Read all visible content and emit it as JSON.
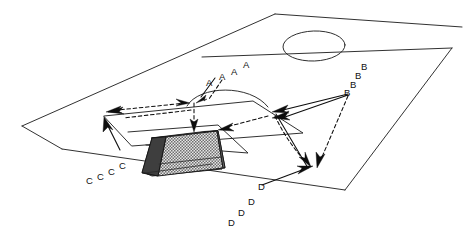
{
  "diagram": {
    "type": "pitch-diagram",
    "view": "three-quarter perspective",
    "canvas": {
      "width": 464,
      "height": 239
    },
    "colors": {
      "background": "#ffffff",
      "line": "#1a1a1a",
      "movement": "#0d0d0d",
      "net_fill": "#d6d6d6",
      "goal_side_shadow": "#4a4a4a"
    },
    "pitch": {
      "outline_note": "half pitch shown in perspective",
      "features": [
        {
          "name": "touchline-top",
          "label": ""
        },
        {
          "name": "touchline-bottom",
          "label": ""
        },
        {
          "name": "goal-line",
          "label": ""
        },
        {
          "name": "halfway-line",
          "label": ""
        },
        {
          "name": "centre-circle",
          "label": ""
        },
        {
          "name": "penalty-area",
          "label": ""
        },
        {
          "name": "goal-area",
          "label": ""
        },
        {
          "name": "penalty-arc",
          "label": ""
        }
      ]
    },
    "goal": {
      "name": "goal-with-net",
      "label": ""
    },
    "groups": [
      {
        "id": "A",
        "label": "A",
        "letter": "A",
        "count": 4,
        "labels": [
          "A",
          "A",
          "A",
          "A"
        ],
        "position": "centre, above penalty arc",
        "movement": "attacking run toward goal"
      },
      {
        "id": "B",
        "label": "B",
        "letter": "B",
        "count": 4,
        "labels": [
          "B",
          "B",
          "B",
          "B"
        ],
        "position": "right side, near halfway line",
        "movement": "run toward near post and corner"
      },
      {
        "id": "C",
        "label": "C",
        "letter": "C",
        "count": 4,
        "labels": [
          "C",
          "C",
          "C",
          "C"
        ],
        "position": "left side, outside penalty area",
        "movement": "run toward far post"
      },
      {
        "id": "D",
        "label": "D",
        "letter": "D",
        "count": 4,
        "labels": [
          "D",
          "D",
          "D",
          "D"
        ],
        "position": "bottom right, outside goal line",
        "movement": "run toward the goal line corner"
      }
    ],
    "arrows": [
      {
        "name": "arrow-a-to-penalty-spot",
        "style": "solid",
        "direction": "down-left"
      },
      {
        "name": "arrow-a-down-to-goal",
        "style": "dashed",
        "direction": "down"
      },
      {
        "name": "arrow-a-pass-left",
        "style": "dashed",
        "direction": "left"
      },
      {
        "name": "arrow-pass-left-far",
        "style": "dashed",
        "direction": "left"
      },
      {
        "name": "arrow-b-to-near-post",
        "style": "solid",
        "direction": "left"
      },
      {
        "name": "arrow-b-dashed-to-corner",
        "style": "dashed",
        "direction": "down-right"
      },
      {
        "name": "arrow-inside-pass-left",
        "style": "dashed",
        "direction": "left"
      },
      {
        "name": "arrow-c-up-left",
        "style": "solid",
        "direction": "up-left"
      },
      {
        "name": "arrow-d-up-to-post",
        "style": "solid",
        "direction": "up-right"
      },
      {
        "name": "arrow-corner-cross",
        "style": "solid",
        "direction": "down-left"
      }
    ]
  }
}
